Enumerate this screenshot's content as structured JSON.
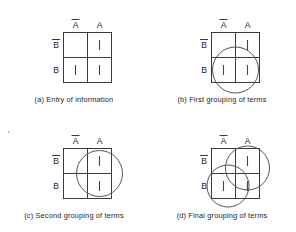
{
  "figure": {
    "background_color": "#ffffff",
    "line_color": "#3a3a3a",
    "text_color": "#252525"
  },
  "labels": {
    "col_not_a": "A",
    "col_a": "A",
    "row_not_b": "B",
    "row_b": "B",
    "overbar_char": "̅"
  },
  "panels": [
    {
      "id": "a",
      "caption": "(a) Entry of information",
      "col_headers": [
        "A̅",
        "A"
      ],
      "row_headers": [
        "B̅",
        "B"
      ],
      "cells": [
        {
          "row": "Bbar",
          "col": "Abar",
          "mark": ""
        },
        {
          "row": "Bbar",
          "col": "A",
          "mark": "|"
        },
        {
          "row": "B",
          "col": "Abar",
          "mark": "|"
        },
        {
          "row": "B",
          "col": "A",
          "mark": "|"
        }
      ],
      "groupings": []
    },
    {
      "id": "b",
      "caption": "(b) First grouping of terms",
      "col_headers": [
        "A̅",
        "A"
      ],
      "row_headers": [
        "B̅",
        "B"
      ],
      "cells": [
        {
          "row": "Bbar",
          "col": "Abar",
          "mark": ""
        },
        {
          "row": "Bbar",
          "col": "A",
          "mark": "|"
        },
        {
          "row": "B",
          "col": "Abar",
          "mark": "|"
        },
        {
          "row": "B",
          "col": "A",
          "mark": "|"
        }
      ],
      "groupings": [
        {
          "name": "bottom-row-group",
          "cx": 72,
          "cy": 70,
          "r": 23
        }
      ]
    },
    {
      "id": "c",
      "caption": "(c) Second grouping of terms",
      "col_headers": [
        "A̅",
        "A"
      ],
      "row_headers": [
        "B̅",
        "B"
      ],
      "cells": [
        {
          "row": "Bbar",
          "col": "Abar",
          "mark": ""
        },
        {
          "row": "Bbar",
          "col": "A",
          "mark": "|"
        },
        {
          "row": "B",
          "col": "Abar",
          "mark": ""
        },
        {
          "row": "B",
          "col": "A",
          "mark": "|"
        }
      ],
      "groupings": [
        {
          "name": "right-column-group",
          "cx": 96,
          "cy": 57,
          "r": 23
        }
      ]
    },
    {
      "id": "d",
      "caption": "(d) Final grouping of terms",
      "col_headers": [
        "A̅",
        "A"
      ],
      "row_headers": [
        "B̅",
        "B"
      ],
      "cells": [
        {
          "row": "Bbar",
          "col": "Abar",
          "mark": ""
        },
        {
          "row": "Bbar",
          "col": "A",
          "mark": "|"
        },
        {
          "row": "B",
          "col": "Abar",
          "mark": "|"
        },
        {
          "row": "B",
          "col": "A",
          "mark": "|"
        }
      ],
      "groupings": [
        {
          "name": "right-column-group",
          "cx": 96,
          "cy": 57,
          "r": 23
        },
        {
          "name": "bottom-row-group",
          "cx": 72,
          "cy": 70,
          "r": 23
        }
      ]
    }
  ],
  "grid_geometry": {
    "left": 48,
    "top": 32,
    "width": 48,
    "height": 50,
    "note": "2x2 map; columns A-bar | A, rows B-bar / B"
  }
}
